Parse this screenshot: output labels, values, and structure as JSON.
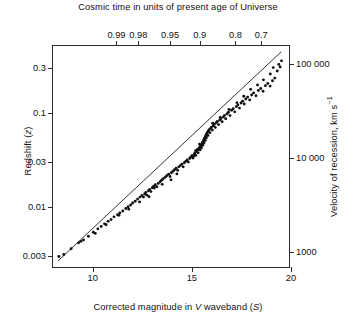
{
  "chart_data": {
    "type": "scatter",
    "title": "Cosmic time in units of present age of Universe",
    "xlabel": "Corrected magnitude in V waveband (S)",
    "ylabel": "Redshift (z)",
    "y2label": "Velocity of recession, km s⁻¹",
    "x2label": "Cosmic time in units of present age of Universe",
    "xlim": [
      8,
      20
    ],
    "ylim": [
      0.0022,
      0.52
    ],
    "yscale": "log",
    "y2lim": [
      660,
      156000
    ],
    "y2scale": "log",
    "grid": false,
    "legend": null,
    "xticks": [
      10,
      15,
      20
    ],
    "xticklabels": [
      "10",
      "15",
      "20"
    ],
    "yticks": [
      0.003,
      0.01,
      0.03,
      0.1,
      0.3
    ],
    "yticklabels": [
      "0.003",
      "0.01",
      "0.03",
      "0.1",
      "0.3"
    ],
    "y2ticks": [
      1000,
      10000,
      100000
    ],
    "y2ticklabels": [
      "1000",
      "10 000",
      "100 000"
    ],
    "x2ticks": [
      11.2,
      12.3,
      13.9,
      15.4,
      17.2,
      18.5
    ],
    "x2ticklabels": [
      "0.99",
      "0.98",
      "0.95",
      "0.9",
      "0.8",
      "0.7"
    ],
    "fit_line": {
      "x": [
        8.25,
        19.6
      ],
      "y": [
        0.00255,
        0.45
      ],
      "description": "Hubble relation best-fit line"
    },
    "points": [
      [
        8.3,
        0.00285
      ],
      [
        8.55,
        0.003
      ],
      [
        8.92,
        0.00345
      ],
      [
        9.3,
        0.004
      ],
      [
        9.55,
        0.0043
      ],
      [
        9.8,
        0.0047
      ],
      [
        10.05,
        0.0052
      ],
      [
        10.28,
        0.00565
      ],
      [
        10.45,
        0.006
      ],
      [
        10.62,
        0.0064
      ],
      [
        10.8,
        0.0068
      ],
      [
        10.95,
        0.0071
      ],
      [
        11.1,
        0.0076
      ],
      [
        11.28,
        0.008
      ],
      [
        11.4,
        0.0084
      ],
      [
        11.55,
        0.0088
      ],
      [
        11.7,
        0.00935
      ],
      [
        11.82,
        0.00975
      ],
      [
        11.95,
        0.0102
      ],
      [
        12.05,
        0.0107
      ],
      [
        12.18,
        0.0112
      ],
      [
        12.3,
        0.0118
      ],
      [
        12.42,
        0.0124
      ],
      [
        12.52,
        0.0129
      ],
      [
        12.6,
        0.0124
      ],
      [
        12.66,
        0.0134
      ],
      [
        12.72,
        0.0139
      ],
      [
        12.78,
        0.013
      ],
      [
        12.85,
        0.0145
      ],
      [
        12.92,
        0.015
      ],
      [
        12.98,
        0.0142
      ],
      [
        13.05,
        0.0156
      ],
      [
        13.12,
        0.0162
      ],
      [
        13.2,
        0.0168
      ],
      [
        13.28,
        0.016
      ],
      [
        13.35,
        0.0174
      ],
      [
        13.45,
        0.0181
      ],
      [
        13.52,
        0.0188
      ],
      [
        13.6,
        0.0195
      ],
      [
        13.7,
        0.0202
      ],
      [
        13.78,
        0.021
      ],
      [
        13.88,
        0.0218
      ],
      [
        13.95,
        0.0206
      ],
      [
        14.02,
        0.0226
      ],
      [
        14.1,
        0.0235
      ],
      [
        14.18,
        0.0244
      ],
      [
        14.26,
        0.0253
      ],
      [
        14.34,
        0.024
      ],
      [
        14.4,
        0.0262
      ],
      [
        14.48,
        0.027
      ],
      [
        14.55,
        0.028
      ],
      [
        14.62,
        0.0262
      ],
      [
        14.68,
        0.029
      ],
      [
        14.75,
        0.03
      ],
      [
        14.82,
        0.031
      ],
      [
        14.88,
        0.0295
      ],
      [
        14.95,
        0.0322
      ],
      [
        15.0,
        0.0333
      ],
      [
        15.06,
        0.0345
      ],
      [
        15.12,
        0.0325
      ],
      [
        15.18,
        0.0358
      ],
      [
        15.22,
        0.037
      ],
      [
        15.26,
        0.0348
      ],
      [
        15.3,
        0.0382
      ],
      [
        15.34,
        0.0395
      ],
      [
        15.38,
        0.037
      ],
      [
        15.42,
        0.0408
      ],
      [
        15.45,
        0.0422
      ],
      [
        15.48,
        0.0398
      ],
      [
        15.5,
        0.0435
      ],
      [
        15.52,
        0.0448
      ],
      [
        15.55,
        0.042
      ],
      [
        15.58,
        0.0462
      ],
      [
        15.6,
        0.0478
      ],
      [
        15.62,
        0.0448
      ],
      [
        15.64,
        0.0492
      ],
      [
        15.66,
        0.0508
      ],
      [
        15.68,
        0.0475
      ],
      [
        15.7,
        0.0525
      ],
      [
        15.72,
        0.054
      ],
      [
        15.74,
        0.0505
      ],
      [
        15.76,
        0.0558
      ],
      [
        15.78,
        0.0575
      ],
      [
        15.8,
        0.0538
      ],
      [
        15.82,
        0.0595
      ],
      [
        15.85,
        0.0615
      ],
      [
        15.88,
        0.057
      ],
      [
        15.9,
        0.0635
      ],
      [
        15.94,
        0.0655
      ],
      [
        15.98,
        0.061
      ],
      [
        16.02,
        0.068
      ],
      [
        16.06,
        0.07
      ],
      [
        16.1,
        0.065
      ],
      [
        16.15,
        0.0725
      ],
      [
        16.2,
        0.075
      ],
      [
        16.25,
        0.0695
      ],
      [
        16.3,
        0.078
      ],
      [
        16.36,
        0.0805
      ],
      [
        16.42,
        0.0745
      ],
      [
        16.48,
        0.0835
      ],
      [
        16.54,
        0.0865
      ],
      [
        16.6,
        0.08
      ],
      [
        16.66,
        0.09
      ],
      [
        16.72,
        0.0935
      ],
      [
        16.78,
        0.086
      ],
      [
        16.85,
        0.097
      ],
      [
        16.92,
        0.101
      ],
      [
        17.0,
        0.093
      ],
      [
        17.08,
        0.106
      ],
      [
        17.16,
        0.11
      ],
      [
        17.24,
        0.102
      ],
      [
        17.32,
        0.116
      ],
      [
        17.4,
        0.121
      ],
      [
        17.48,
        0.112
      ],
      [
        17.56,
        0.127
      ],
      [
        17.64,
        0.133
      ],
      [
        17.72,
        0.124
      ],
      [
        17.8,
        0.14
      ],
      [
        17.9,
        0.147
      ],
      [
        18.0,
        0.137
      ],
      [
        18.1,
        0.155
      ],
      [
        18.2,
        0.163
      ],
      [
        18.32,
        0.152
      ],
      [
        18.44,
        0.173
      ],
      [
        18.56,
        0.182
      ],
      [
        18.68,
        0.17
      ],
      [
        18.8,
        0.195
      ],
      [
        18.92,
        0.206
      ],
      [
        19.04,
        0.193
      ],
      [
        19.16,
        0.22
      ],
      [
        19.28,
        0.235
      ],
      [
        19.4,
        0.28
      ],
      [
        19.48,
        0.33
      ],
      [
        19.55,
        0.31
      ],
      [
        19.62,
        0.36
      ],
      [
        19.2,
        0.305
      ],
      [
        19.05,
        0.26
      ],
      [
        18.7,
        0.225
      ],
      [
        18.4,
        0.198
      ],
      [
        18.05,
        0.178
      ],
      [
        17.7,
        0.15
      ],
      [
        17.35,
        0.128
      ],
      [
        16.95,
        0.108
      ],
      [
        16.5,
        0.089
      ],
      [
        16.12,
        0.077
      ],
      [
        15.45,
        0.046
      ],
      [
        15.35,
        0.0405
      ],
      [
        15.25,
        0.039
      ],
      [
        15.15,
        0.034
      ],
      [
        14.3,
        0.022
      ],
      [
        14.0,
        0.019
      ],
      [
        13.55,
        0.017
      ],
      [
        13.15,
        0.0155
      ],
      [
        12.88,
        0.0125
      ],
      [
        12.4,
        0.011
      ],
      [
        11.85,
        0.0092
      ],
      [
        11.35,
        0.0079
      ],
      [
        10.7,
        0.00625
      ],
      [
        10.15,
        0.00505
      ],
      [
        9.42,
        0.00415
      ]
    ]
  }
}
